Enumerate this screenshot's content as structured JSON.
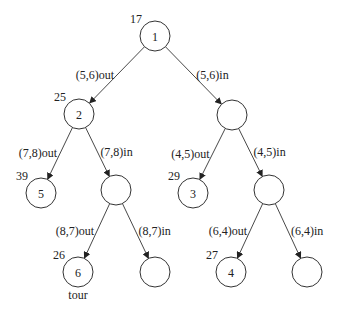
{
  "diagram": {
    "type": "branch-and-bound-tree",
    "nodes": [
      {
        "id": "n1",
        "label": "1",
        "cost": "17",
        "note": ""
      },
      {
        "id": "n2",
        "label": "2",
        "cost": "25",
        "note": ""
      },
      {
        "id": "nR",
        "label": "",
        "cost": "",
        "note": ""
      },
      {
        "id": "n5",
        "label": "5",
        "cost": "39",
        "note": ""
      },
      {
        "id": "nL2",
        "label": "",
        "cost": "",
        "note": ""
      },
      {
        "id": "n3",
        "label": "3",
        "cost": "29",
        "note": ""
      },
      {
        "id": "nR2",
        "label": "",
        "cost": "",
        "note": ""
      },
      {
        "id": "n6",
        "label": "6",
        "cost": "26",
        "note": "tour"
      },
      {
        "id": "nL3",
        "label": "",
        "cost": "",
        "note": ""
      },
      {
        "id": "n4",
        "label": "4",
        "cost": "27",
        "note": ""
      },
      {
        "id": "nR3",
        "label": "",
        "cost": "",
        "note": ""
      }
    ],
    "edges": [
      {
        "from": "n1",
        "to": "n2",
        "label": "(5,6)out"
      },
      {
        "from": "n1",
        "to": "nR",
        "label": "(5,6)in"
      },
      {
        "from": "n2",
        "to": "n5",
        "label": "(7,8)out"
      },
      {
        "from": "n2",
        "to": "nL2",
        "label": "(7,8)in"
      },
      {
        "from": "nR",
        "to": "n3",
        "label": "(4,5)out"
      },
      {
        "from": "nR",
        "to": "nR2",
        "label": "(4,5)in"
      },
      {
        "from": "nL2",
        "to": "n6",
        "label": "(8,7)out"
      },
      {
        "from": "nL2",
        "to": "nL3",
        "label": "(8,7)in"
      },
      {
        "from": "nR2",
        "to": "n4",
        "label": "(6,4)out"
      },
      {
        "from": "nR2",
        "to": "nR3",
        "label": "(6,4)in"
      }
    ]
  }
}
